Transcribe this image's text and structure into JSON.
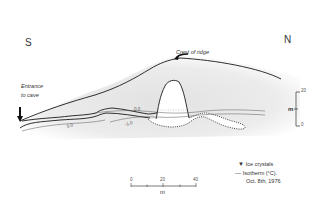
{
  "diagram": {
    "compass": {
      "south": "S",
      "north": "N"
    },
    "annotations": {
      "crest": "Crest of ridge",
      "entrance_line1": "Entrance",
      "entrance_line2": "to cave"
    },
    "isotherms": [
      {
        "label": "5.0",
        "unit": "°C"
      },
      {
        "label": "0.0",
        "unit": "°C"
      },
      {
        "label": "-1.0",
        "unit": "°C"
      }
    ],
    "vertical_scale": {
      "unit": "m",
      "top": "20",
      "bottom": "0"
    },
    "horizontal_scale": {
      "unit": "m",
      "ticks": [
        "0",
        "20",
        "40"
      ]
    },
    "legend": {
      "ice_symbol": "▼",
      "ice_label": "Ice crystals",
      "isotherm_symbol": "—",
      "isotherm_label": "Isotherm (°C).",
      "date": "Oct. 8th, 1976"
    },
    "colors": {
      "ink": "#222222",
      "shading": "#e6e6e6",
      "background": "#ffffff"
    }
  }
}
